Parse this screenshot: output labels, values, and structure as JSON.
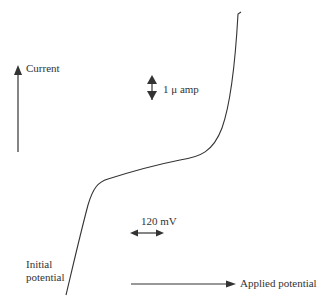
{
  "diagram": {
    "type": "polarogram / current-potential wave",
    "axes": {
      "y_label": "Current",
      "x_label": "Applied potential"
    },
    "scale_bars": {
      "current": "1 μ amp",
      "potential": "120 mV"
    },
    "annotations": {
      "start_label_line1": "Initial",
      "start_label_line2": "potential"
    },
    "colors": {
      "line": "#333333",
      "background": "#ffffff"
    }
  }
}
